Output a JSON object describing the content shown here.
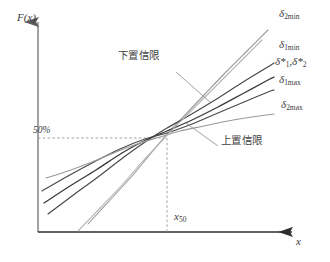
{
  "figure": {
    "type": "line",
    "background_color": "#ffffff",
    "axes": {
      "y_label": "F(x)",
      "x_label": "x",
      "axis_color": "#8c8c8c",
      "y_axis_x": 38,
      "y_axis_top": 18,
      "y_axis_bottom": 232,
      "x_axis_y": 232,
      "x_axis_left": 38,
      "x_axis_right": 298
    },
    "reference_lines": {
      "horizontal": {
        "label": "50%",
        "value_text": "50%",
        "y": 138,
        "style": "dashed",
        "color": "#9a9a9a"
      },
      "vertical": {
        "label": "x50",
        "label_base": "x",
        "label_sub": "50",
        "x": 167,
        "style": "dashed",
        "color": "#9a9a9a"
      }
    },
    "annotations": [
      {
        "id": "lower-confidence-limit",
        "text": "下置信限",
        "x": 118,
        "y": 55,
        "leader_from": [
          176,
          72
        ],
        "leader_to": [
          210,
          102
        ]
      },
      {
        "id": "upper-confidence-limit",
        "text": "上置信限",
        "x": 221,
        "y": 140,
        "leader_from": [
          218,
          146
        ],
        "leader_to": [
          186,
          123
        ]
      }
    ],
    "curve_labels": [
      {
        "id": "delta-2min",
        "base": "δ",
        "sub": "2min",
        "x": 279,
        "y": 14,
        "color": "#4a4a4a"
      },
      {
        "id": "delta-1min",
        "base": "δ",
        "sub": "1min",
        "x": 279,
        "y": 45,
        "color": "#4a4a4a"
      },
      {
        "id": "delta-star",
        "base": "δ*",
        "sub": "1",
        "base2": "δ*",
        "sub2": "2",
        "x": 275,
        "y": 62,
        "color": "#4a4a4a"
      },
      {
        "id": "delta-1max",
        "base": "δ",
        "sub": "1max",
        "x": 279,
        "y": 80,
        "color": "#4a4a4a"
      },
      {
        "id": "delta-2max",
        "base": "δ",
        "sub": "2max",
        "x": 281,
        "y": 105,
        "color": "#4a4a4a"
      }
    ],
    "curves": [
      {
        "id": "delta-2min-curve",
        "label": "δ2min",
        "color": "#9a9a9a",
        "width": 1.1,
        "points": [
          [
            88,
            224
          ],
          [
            110,
            200
          ],
          [
            132,
            176
          ],
          [
            152,
            152
          ],
          [
            168,
            133
          ],
          [
            186,
            114
          ],
          [
            205,
            94
          ],
          [
            226,
            72
          ],
          [
            248,
            50
          ],
          [
            268,
            30
          ]
        ]
      },
      {
        "id": "delta-1min-curve",
        "label": "δ1min",
        "color": "#4a4a4a",
        "width": 1.2,
        "points": [
          [
            48,
            214
          ],
          [
            72,
            196
          ],
          [
            98,
            177
          ],
          [
            124,
            157
          ],
          [
            148,
            140
          ],
          [
            167,
            128
          ],
          [
            190,
            115
          ],
          [
            215,
            100
          ],
          [
            240,
            84
          ],
          [
            266,
            68
          ],
          [
            274,
            63
          ]
        ]
      },
      {
        "id": "delta-star-curve",
        "label": "δ*1,δ*2",
        "color": "#3a3a3a",
        "width": 1.3,
        "points": [
          [
            44,
            203
          ],
          [
            70,
            186
          ],
          [
            96,
            170
          ],
          [
            122,
            153
          ],
          [
            146,
            140
          ],
          [
            167,
            131
          ],
          [
            192,
            120
          ],
          [
            218,
            107
          ],
          [
            244,
            93
          ],
          [
            268,
            80
          ],
          [
            274,
            77
          ]
        ]
      },
      {
        "id": "delta-1max-curve",
        "label": "δ1max",
        "color": "#4a4a4a",
        "width": 1.2,
        "points": [
          [
            42,
            191
          ],
          [
            68,
            176
          ],
          [
            94,
            162
          ],
          [
            120,
            149
          ],
          [
            145,
            139
          ],
          [
            167,
            133
          ],
          [
            192,
            124
          ],
          [
            218,
            113
          ],
          [
            244,
            102
          ],
          [
            268,
            92
          ],
          [
            274,
            90
          ]
        ]
      },
      {
        "id": "delta-2max-curve",
        "label": "δ2max",
        "color": "#9a9a9a",
        "width": 1.1,
        "points": [
          [
            46,
            178
          ],
          [
            68,
            171
          ],
          [
            92,
            162
          ],
          [
            116,
            152
          ],
          [
            140,
            143
          ],
          [
            160,
            137
          ],
          [
            180,
            131
          ],
          [
            204,
            126
          ],
          [
            228,
            121
          ],
          [
            252,
            117
          ],
          [
            274,
            114
          ]
        ]
      },
      {
        "id": "steep-lower-curve",
        "label": "steep-lower",
        "color": "#b4b4b4",
        "width": 1.1,
        "points": [
          [
            78,
            231
          ],
          [
            100,
            208
          ],
          [
            122,
            185
          ],
          [
            142,
            162
          ],
          [
            158,
            145
          ],
          [
            172,
            130
          ],
          [
            188,
            114
          ],
          [
            206,
            96
          ],
          [
            226,
            76
          ],
          [
            246,
            56
          ],
          [
            262,
            40
          ]
        ]
      }
    ]
  }
}
